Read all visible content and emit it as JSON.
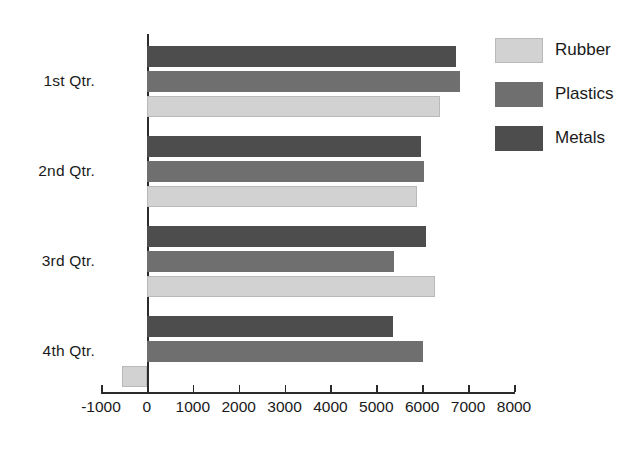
{
  "chart_data": {
    "type": "bar",
    "orientation": "horizontal",
    "title": "",
    "xlabel": "",
    "ylabel": "",
    "categories": [
      "1st Qtr.",
      "2nd Qtr.",
      "3rd Qtr.",
      "4th Qtr."
    ],
    "series": [
      {
        "name": "Rubber",
        "color": "#d2d2d2",
        "values": [
          6380,
          5890,
          6270,
          -550
        ]
      },
      {
        "name": "Plastics",
        "color": "#6f6f6f",
        "values": [
          6820,
          6040,
          5380,
          6010
        ]
      },
      {
        "name": "Metals",
        "color": "#4d4d4d",
        "values": [
          6730,
          5970,
          6080,
          5360
        ]
      }
    ],
    "xlim": [
      -1000,
      8000
    ],
    "xticks": [
      -1000,
      0,
      1000,
      2000,
      3000,
      4000,
      5000,
      6000,
      7000,
      8000
    ],
    "xtick_labels": [
      "-1000",
      "0",
      "1000",
      "2000",
      "3000",
      "4000",
      "5000",
      "6000",
      "7000",
      "8000"
    ],
    "grid": false,
    "legend_position": "right",
    "series_order_top_to_bottom": [
      "Metals",
      "Plastics",
      "Rubber"
    ],
    "legend_order_top_to_bottom": [
      "Rubber",
      "Plastics",
      "Metals"
    ]
  }
}
